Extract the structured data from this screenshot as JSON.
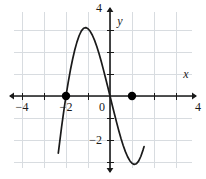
{
  "chart_data": {
    "type": "line",
    "title": "",
    "subtitle": "",
    "xlabel": "x",
    "ylabel": "y",
    "xlim": [
      -5.4,
      5.4
    ],
    "ylim": [
      -5.2,
      5.2
    ],
    "grid": true,
    "grid_step": 1,
    "legend": "none",
    "x_tick_labels": [
      "-4",
      "-2",
      "0",
      "4"
    ],
    "x_tick_values": [
      -4,
      -2,
      0,
      4
    ],
    "y_tick_labels": [
      "4",
      "-2",
      "-4"
    ],
    "y_tick_values": [
      4,
      -2,
      -4
    ],
    "series": [
      {
        "name": "cubic curve",
        "color": "#1a1a1a",
        "x": [
          -2.35,
          -2.2,
          -2.1,
          -2.0,
          -1.9,
          -1.8,
          -1.7,
          -1.6,
          -1.5,
          -1.4,
          -1.3,
          -1.2,
          -1.1,
          -1.0,
          -0.9,
          -0.8,
          -0.7,
          -0.6,
          -0.5,
          -0.4,
          -0.3,
          -0.2,
          -0.1,
          0.0,
          0.1,
          0.2,
          0.3,
          0.4,
          0.5,
          0.6,
          0.7,
          0.8,
          0.9,
          1.0,
          1.1,
          1.2,
          1.3,
          1.4,
          1.5,
          1.55
        ],
        "y": [
          -2.6,
          -1.4,
          -0.68,
          0.0,
          0.62,
          1.18,
          1.67,
          2.1,
          2.46,
          2.75,
          2.96,
          3.08,
          3.11,
          3.06,
          2.94,
          2.76,
          2.53,
          2.25,
          1.93,
          1.58,
          1.2,
          0.81,
          0.41,
          0.0,
          -0.41,
          -0.81,
          -1.2,
          -1.58,
          -1.93,
          -2.25,
          -2.53,
          -2.76,
          -2.94,
          -3.06,
          -3.11,
          -3.08,
          -2.96,
          -2.75,
          -2.46,
          -2.3
        ]
      }
    ],
    "marked_points": [
      {
        "label": "zero at x = -2",
        "x": -2,
        "y": 0
      },
      {
        "label": "zero at x = 1",
        "x": 1,
        "y": 0
      }
    ],
    "annotations": {
      "local_max": {
        "x": -1.1,
        "y": 3.1
      },
      "local_min": {
        "x": 1.1,
        "y": -3.1
      }
    },
    "colors": {
      "curve": "#1a1a1a",
      "axis": "#1a1a1a",
      "grid": "#d8dce0",
      "point": "#000000",
      "background": "#ffffff"
    }
  }
}
